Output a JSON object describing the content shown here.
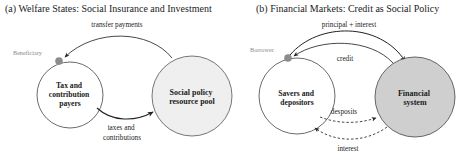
{
  "panel_a": {
    "title": "(a) Welfare States: Social Insurance and Investment",
    "marker_label": "Beneficiary",
    "nodes": {
      "payers": {
        "lines": [
          "Tax and",
          "contribution",
          "payers"
        ],
        "fill": "#ffffff"
      },
      "pool": {
        "lines": [
          "Social policy",
          "resource pool"
        ],
        "fill": "#efefef"
      }
    },
    "edges": {
      "transfer": {
        "label": "transfer payments"
      },
      "taxes": {
        "lines": [
          "taxes and",
          "contributions"
        ]
      }
    }
  },
  "panel_b": {
    "title": "(b) Financial Markets: Credit as Social Policy",
    "marker_label": "Borrower",
    "nodes": {
      "savers": {
        "lines": [
          "Savers and",
          "depositors"
        ],
        "fill": "#ffffff"
      },
      "financial": {
        "lines": [
          "Financial",
          "system"
        ],
        "fill": "#cfcfcf"
      }
    },
    "edges": {
      "principal": {
        "label": "principal + interest"
      },
      "credit": {
        "label": "credit"
      },
      "deposits": {
        "label": "desposits"
      },
      "interest": {
        "label": "interest"
      }
    }
  },
  "colors": {
    "stroke": "#444444",
    "marker_dot": "#8c8c8c",
    "marker_text": "#8a8a8a"
  }
}
